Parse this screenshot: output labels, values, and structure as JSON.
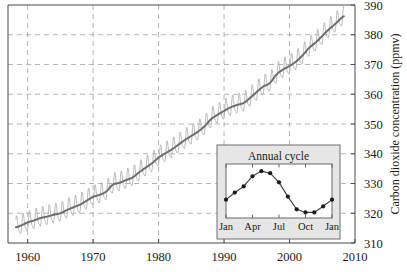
{
  "chart_data": {
    "type": "line",
    "title": "",
    "xlabel": "",
    "ylabel": "Carbon dioxide concentration (ppmv)",
    "xlim": [
      1957.0,
      2010.0
    ],
    "ylim": [
      310,
      390
    ],
    "xticks": [
      1960,
      1970,
      1980,
      1990,
      2000,
      2010
    ],
    "xtick_labels": [
      "1960",
      "1970",
      "1980",
      "1990",
      "2000",
      "2010"
    ],
    "yticks": [
      310,
      320,
      330,
      340,
      350,
      360,
      370,
      380,
      390
    ],
    "ytick_labels": [
      "310",
      "320",
      "330",
      "340",
      "350",
      "360",
      "370",
      "380",
      "390"
    ],
    "y_axis_side": "right",
    "grid": true,
    "grid_style": "dashed",
    "legend": "none",
    "series": [
      {
        "name": "Monthly mean CO2",
        "color": "#b4b4b4",
        "style": "line-seasonal",
        "seasonal_amplitude_ppmv": 3.1,
        "seasonal_peak_month": 5,
        "x": [
          1958.2,
          1959,
          1960,
          1961,
          1962,
          1963,
          1964,
          1965,
          1966,
          1967,
          1968,
          1969,
          1970,
          1971,
          1972,
          1973,
          1974,
          1975,
          1976,
          1977,
          1978,
          1979,
          1980,
          1981,
          1982,
          1983,
          1984,
          1985,
          1986,
          1987,
          1988,
          1989,
          1990,
          1991,
          1992,
          1993,
          1994,
          1995,
          1996,
          1997,
          1998,
          1999,
          2000,
          2001,
          2002,
          2003,
          2004,
          2005,
          2006,
          2007,
          2008.3
        ],
        "trend_values": [
          315.3,
          315.9,
          316.9,
          317.6,
          318.4,
          318.9,
          319.5,
          320.0,
          321.1,
          322.0,
          322.9,
          324.2,
          325.5,
          326.2,
          327.3,
          329.6,
          330.2,
          331.1,
          332.0,
          333.7,
          335.3,
          336.8,
          338.7,
          340.1,
          341.4,
          343.0,
          344.6,
          346.0,
          347.4,
          349.2,
          351.6,
          353.1,
          354.4,
          355.6,
          356.4,
          357.1,
          358.8,
          360.8,
          362.6,
          363.8,
          366.6,
          368.3,
          369.5,
          371.0,
          373.1,
          375.6,
          377.4,
          379.6,
          381.8,
          383.7,
          386.2
        ]
      },
      {
        "name": "Smoothed trend",
        "color": "#6e6e6e",
        "style": "line-smooth"
      }
    ],
    "inset": {
      "title": "Annual cycle",
      "type": "line-markers",
      "marker": "filled-circle",
      "marker_color": "#1a1a1a",
      "line_color": "#3c3c3c",
      "background": "#e6e6e6",
      "plot_background": "#ffffff",
      "xticks": [
        "Jan",
        "Apr",
        "Jul",
        "Oct",
        "Jan"
      ],
      "xtick_positions": [
        0,
        3,
        6,
        9,
        12
      ],
      "months": [
        "Jan",
        "Feb",
        "Mar",
        "Apr",
        "May",
        "Jun",
        "Jul",
        "Aug",
        "Sep",
        "Oct",
        "Nov",
        "Dec",
        "Jan"
      ],
      "values": [
        328.2,
        329.6,
        330.8,
        332.8,
        333.8,
        333.4,
        331.6,
        328.8,
        326.3,
        325.7,
        325.7,
        326.9,
        328.2
      ],
      "ylim": [
        324.6,
        335.2
      ],
      "grid": false
    }
  }
}
